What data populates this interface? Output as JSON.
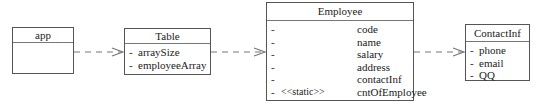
{
  "diagram": {
    "type": "uml-class-dependency",
    "classes": [
      {
        "name": "app",
        "attributes": []
      },
      {
        "name": "Table",
        "attributes": [
          {
            "visibility": "-",
            "name": "arraySize"
          },
          {
            "visibility": "-",
            "name": "employeeArray"
          }
        ]
      },
      {
        "name": "Employee",
        "attributes": [
          {
            "visibility": "-",
            "stereotype": "",
            "name": "code"
          },
          {
            "visibility": "-",
            "stereotype": "",
            "name": "name"
          },
          {
            "visibility": "-",
            "stereotype": "",
            "name": "salary"
          },
          {
            "visibility": "-",
            "stereotype": "",
            "name": "address"
          },
          {
            "visibility": "-",
            "stereotype": "",
            "name": "contactInf"
          },
          {
            "visibility": "-",
            "stereotype": "<<static>>",
            "name": "cntOfEmployee"
          }
        ]
      },
      {
        "name": "ContactInf",
        "attributes": [
          {
            "visibility": "-",
            "name": "phone"
          },
          {
            "visibility": "-",
            "name": "email"
          },
          {
            "visibility": "-",
            "name": "QQ"
          }
        ]
      }
    ],
    "dependencies": [
      {
        "from": "app",
        "to": "Table",
        "style": "dashed-open-arrow"
      },
      {
        "from": "Table",
        "to": "Employee",
        "style": "dashed-open-arrow"
      },
      {
        "from": "Employee",
        "to": "ContactInf",
        "style": "dashed-open-arrow"
      }
    ],
    "colors": {
      "line": "#555555",
      "text": "#222222",
      "background": "#ffffff"
    }
  }
}
